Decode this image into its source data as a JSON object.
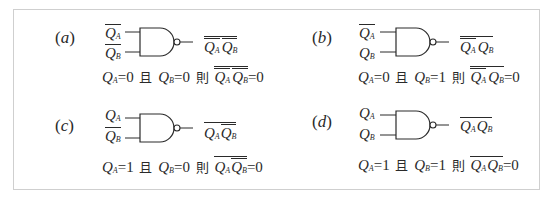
{
  "figure": {
    "panels": [
      {
        "id": "a",
        "label": "a",
        "inputs": [
          {
            "symbol": "Q",
            "sub": "A",
            "negated": true
          },
          {
            "symbol": "Q",
            "sub": "B",
            "negated": true
          }
        ],
        "output_text": "NOT(NOT QA · NOT QB)",
        "equation": {
          "qa": "0",
          "and": "且",
          "qb": "0",
          "then": "則",
          "result": "=0"
        }
      },
      {
        "id": "b",
        "label": "b",
        "inputs": [
          {
            "symbol": "Q",
            "sub": "A",
            "negated": true
          },
          {
            "symbol": "Q",
            "sub": "B",
            "negated": false
          }
        ],
        "output_text": "NOT(NOT QA · QB)",
        "equation": {
          "qa": "0",
          "and": "且",
          "qb": "1",
          "then": "則",
          "result": "=0"
        }
      },
      {
        "id": "c",
        "label": "c",
        "inputs": [
          {
            "symbol": "Q",
            "sub": "A",
            "negated": false
          },
          {
            "symbol": "Q",
            "sub": "B",
            "negated": true
          }
        ],
        "output_text": "NOT(QA · NOT QB)",
        "equation": {
          "qa": "1",
          "and": "且",
          "qb": "0",
          "then": "則",
          "result": "=0"
        }
      },
      {
        "id": "d",
        "label": "d",
        "inputs": [
          {
            "symbol": "Q",
            "sub": "A",
            "negated": false
          },
          {
            "symbol": "Q",
            "sub": "B",
            "negated": false
          }
        ],
        "output_text": "NOT(QA · QB)",
        "equation": {
          "qa": "1",
          "and": "且",
          "qb": "1",
          "then": "則",
          "result": "=0"
        }
      }
    ],
    "text": {
      "Q": "Q",
      "A": "A",
      "B": "B",
      "eq_sign": "="
    },
    "colors": {
      "line": "#2a2a2a",
      "border": "#cfcfcf"
    }
  }
}
